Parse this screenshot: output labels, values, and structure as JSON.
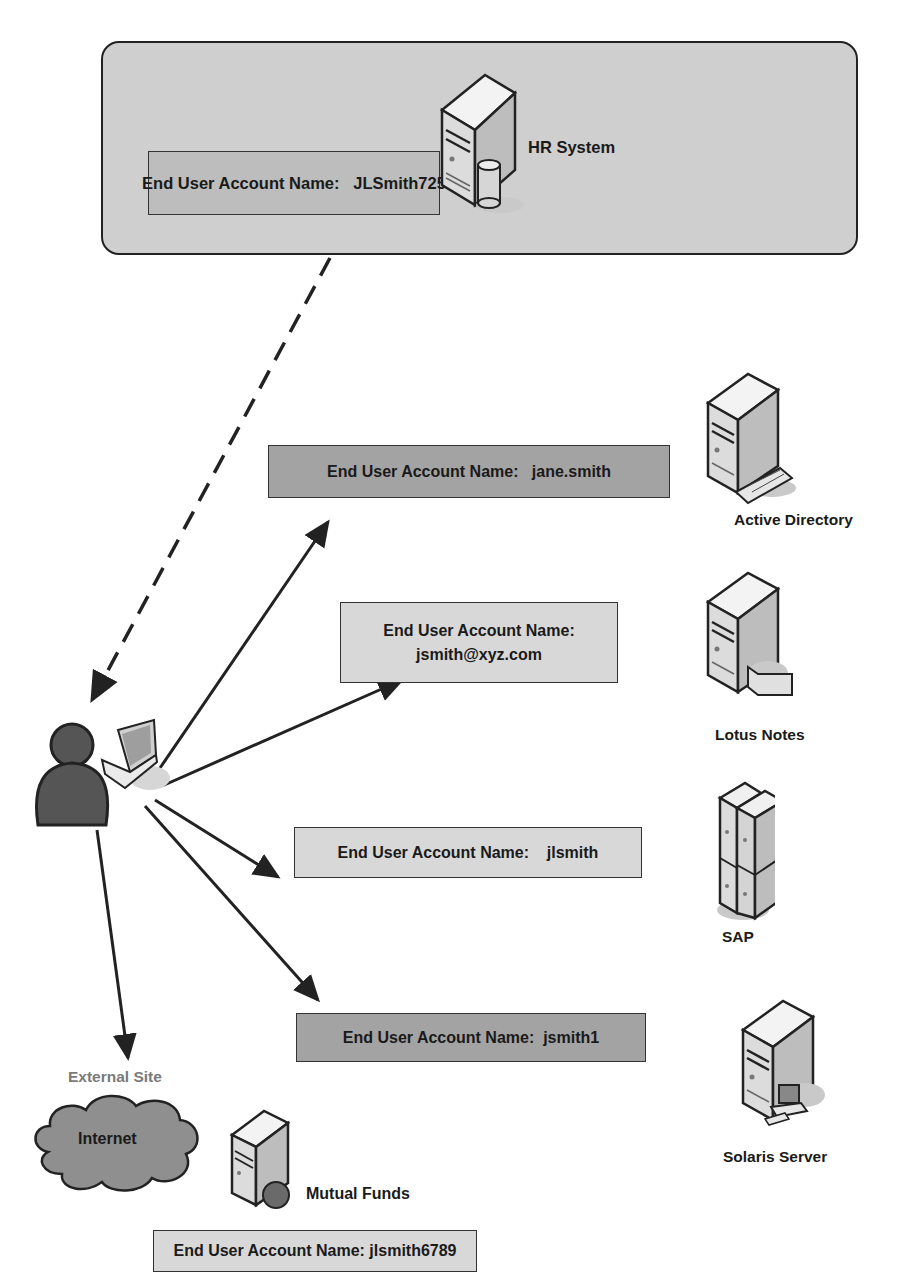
{
  "hr_system": {
    "label": "HR System",
    "account_text": "End User Account Name:   JLSmith725",
    "icon": "server-with-database-icon"
  },
  "systems": [
    {
      "label": "Active Directory",
      "account_text": "End User Account Name:   jane.smith",
      "icon": "server-with-keyboard-icon"
    },
    {
      "label": "Lotus Notes",
      "account_line1": "End User Account Name:",
      "account_line2": "jsmith@xyz.com",
      "icon": "server-with-mail-icon"
    },
    {
      "label": "SAP",
      "account_text": "End User Account Name:    jlsmith",
      "icon": "server-cluster-icon"
    },
    {
      "label": "Solaris Server",
      "account_text": "End User Account Name:  jsmith1",
      "icon": "server-with-workstation-icon"
    }
  ],
  "external": {
    "heading": "External Site",
    "cloud_label": "Internet",
    "server_label": "Mutual Funds",
    "account_text": "End User Account Name: jlsmith6789",
    "icon": "server-with-globe-icon"
  },
  "user": {
    "icon": "user-with-laptop-icon"
  },
  "colors": {
    "panel": "#cfcfcf",
    "box_dark": "#a3a3a3",
    "box_light": "#d8d8d8",
    "line": "#222222",
    "grey_text": "#7a7a7a"
  }
}
